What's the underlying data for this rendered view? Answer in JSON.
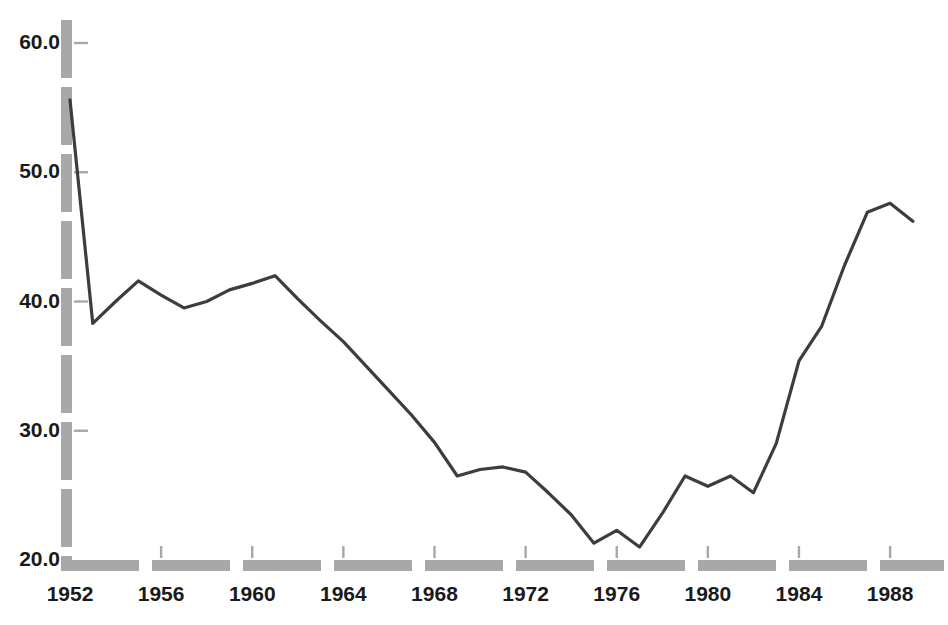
{
  "chart_data": {
    "type": "line",
    "title": "",
    "subtitle": "",
    "xlabel": "",
    "ylabel": "",
    "xlim": [
      1951.4,
      1989.6
    ],
    "ylim": [
      20.0,
      62.0
    ],
    "grid": false,
    "legend": null,
    "legend_position": "none",
    "line_color": "#3d3d3d",
    "axis_color": "#a8a8a8",
    "tick_label_color": "#1a1a1a",
    "y_ticks": [
      {
        "value": 20.0,
        "label": "20.0"
      },
      {
        "value": 30.0,
        "label": "30.0"
      },
      {
        "value": 40.0,
        "label": "40.0"
      },
      {
        "value": 50.0,
        "label": "50.0"
      },
      {
        "value": 60.0,
        "label": "60.0"
      }
    ],
    "x_ticks": [
      {
        "value": 1952,
        "label": "1952"
      },
      {
        "value": 1956,
        "label": "1956"
      },
      {
        "value": 1960,
        "label": "1960"
      },
      {
        "value": 1964,
        "label": "1964"
      },
      {
        "value": 1968,
        "label": "1968"
      },
      {
        "value": 1972,
        "label": "1972"
      },
      {
        "value": 1976,
        "label": "1976"
      },
      {
        "value": 1980,
        "label": "1980"
      },
      {
        "value": 1984,
        "label": "1984"
      },
      {
        "value": 1988,
        "label": "1988"
      }
    ],
    "x": [
      1952,
      1953,
      1954,
      1955,
      1956,
      1957,
      1958,
      1959,
      1960,
      1961,
      1962,
      1963,
      1964,
      1965,
      1966,
      1967,
      1968,
      1969,
      1970,
      1971,
      1972,
      1973,
      1974,
      1975,
      1976,
      1977,
      1978,
      1979,
      1980,
      1981,
      1982,
      1983,
      1984,
      1985,
      1986,
      1987,
      1988,
      1989
    ],
    "values": [
      55.6,
      38.3,
      40.0,
      41.6,
      40.5,
      39.5,
      40.0,
      40.9,
      41.4,
      42.0,
      40.2,
      38.5,
      36.9,
      35.0,
      33.1,
      31.2,
      29.1,
      26.5,
      27.0,
      27.2,
      26.8,
      25.2,
      23.5,
      21.3,
      22.3,
      21.0,
      23.6,
      26.5,
      25.7,
      26.5,
      25.2,
      29.0,
      35.4,
      38.1,
      42.8,
      46.9,
      47.6,
      46.2
    ],
    "series_name": "series-1",
    "marker": "none",
    "line_width": 3.2
  }
}
